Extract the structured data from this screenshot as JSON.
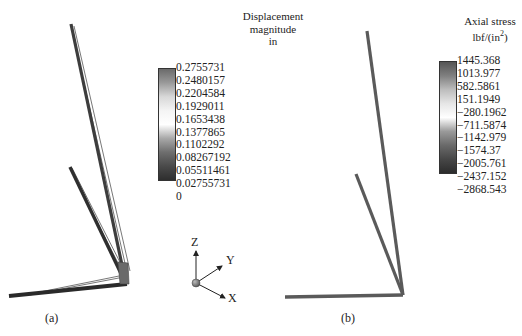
{
  "panels": [
    {
      "id": "a",
      "caption": "(a)",
      "legend": {
        "title_lines": [
          "Displacement",
          "magnitude",
          "in"
        ],
        "ticks": [
          "0.2755731",
          "0.2480157",
          "0.2204584",
          "0.1929011",
          "0.1653438",
          "0.1377865",
          "0.1102292",
          "0.08267192",
          "0.05511461",
          "0.02755731",
          "0"
        ],
        "gradient": [
          "#6a6a6a",
          "#9a9a9a",
          "#d8d8d8",
          "#f4f4f4",
          "#ffffff",
          "#a8a8a8",
          "#6e6e6e",
          "#4a4a4a",
          "#2e2e2e"
        ]
      }
    },
    {
      "id": "b",
      "caption": "(b)",
      "legend": {
        "title_line1": "Axial stress",
        "unit_base": "lbf/(in",
        "unit_sup": "2",
        "unit_close": ")",
        "ticks": [
          "1445.368",
          "1013.977",
          "582.5861",
          "151.1949",
          "−280.1962",
          "−711.5874",
          "−1142.979",
          "−1574.37",
          "−2005.761",
          "−2437.152",
          "−2868.543"
        ],
        "gradient": [
          "#555555",
          "#808080",
          "#bdbdbd",
          "#e6e6e6",
          "#ffffff",
          "#9a9a9a",
          "#6a6a6a",
          "#474747",
          "#2c2c2c"
        ]
      }
    }
  ],
  "triad": {
    "x_label": "X",
    "y_label": "Y",
    "z_label": "Z"
  },
  "colors": {
    "member_stress": "#5a5a5a",
    "member_dark": "#2b2b2b",
    "wire": "#555555"
  }
}
